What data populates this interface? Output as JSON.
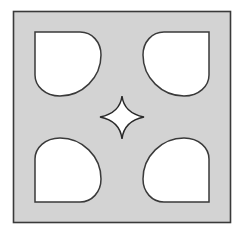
{
  "diagram": {
    "colors": {
      "background": "#ffffff",
      "tile_fill": "#d3d3d3",
      "stroke": "#3a3a3a",
      "cutout_fill": "#ffffff"
    },
    "outer_square": {
      "x": 13,
      "y": 11,
      "width": 218,
      "height": 212
    },
    "cutouts": [
      {
        "name": "top-left",
        "square_corner": "top-left"
      },
      {
        "name": "top-right",
        "square_corner": "top-right"
      },
      {
        "name": "bottom-left",
        "square_corner": "bottom-left"
      },
      {
        "name": "bottom-right",
        "square_corner": "bottom-right"
      }
    ],
    "center_star": {
      "cx": 122,
      "cy": 117,
      "points": 4
    }
  }
}
